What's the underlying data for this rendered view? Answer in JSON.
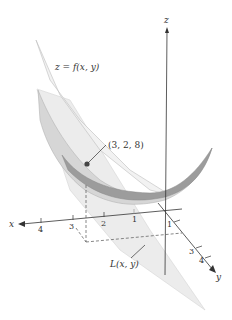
{
  "figure": {
    "labels": {
      "surface": "z = f(x, y)",
      "tangent_plane": "L(x, y)",
      "point": "(3, 2, 8)",
      "z_axis": "z",
      "x_axis": "x",
      "y_axis": "y"
    },
    "x_ticks": [
      "4",
      "3",
      "2",
      "1"
    ],
    "y_ticks": [
      "1",
      "3",
      "4"
    ],
    "colors": {
      "surface_fill": "#d9d9d9",
      "surface_band": "#9a9a9a",
      "plane_fill": "#e6e6e6",
      "axis": "#333333",
      "point": "#444444"
    }
  }
}
